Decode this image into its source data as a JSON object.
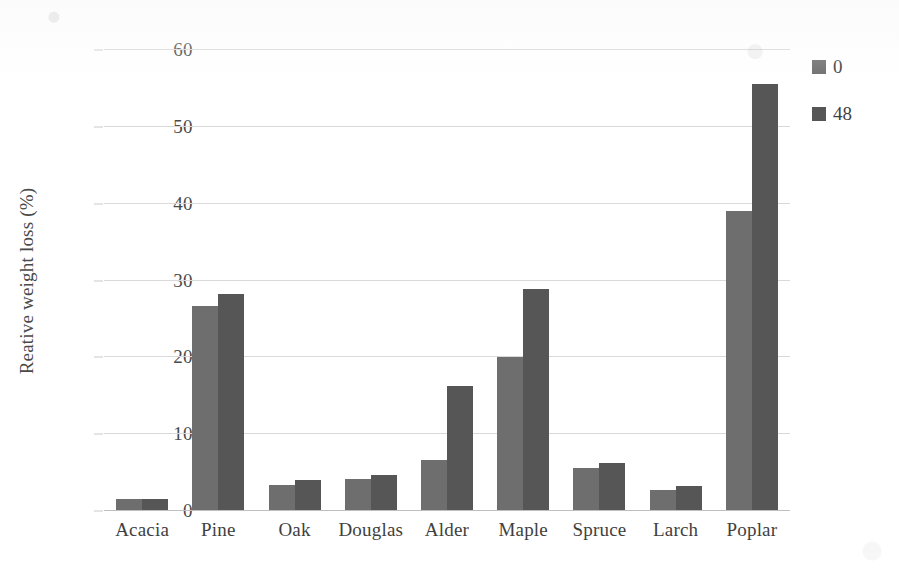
{
  "chart_data": {
    "type": "bar",
    "title": "",
    "subtitle": "",
    "xlabel": "",
    "ylabel": "Reative weight loss (%)",
    "categories": [
      "Acacia",
      "Pine",
      "Oak",
      "Douglas",
      "Alder",
      "Maple",
      "Spruce",
      "Larch",
      "Poplar"
    ],
    "series": [
      {
        "name": "0",
        "color": "#6e6e6e",
        "values": [
          1.6,
          26.7,
          3.4,
          4.2,
          6.7,
          20.0,
          5.6,
          2.7,
          39.0
        ]
      },
      {
        "name": "48",
        "color": "#565656",
        "values": [
          1.6,
          28.2,
          4.0,
          4.7,
          16.3,
          28.9,
          6.2,
          3.2,
          55.6
        ]
      }
    ],
    "ylim": [
      0,
      60
    ],
    "yticks": [
      "0",
      "10",
      "20",
      "30",
      "40",
      "50",
      "60"
    ],
    "ytick_values": [
      0,
      10,
      20,
      30,
      40,
      50,
      60
    ],
    "grid": "horizontal",
    "legend_position": "right-top",
    "legend_entries": [
      {
        "label": "0",
        "color": "#6e6e6e"
      },
      {
        "label": "48",
        "color": "#565656"
      }
    ]
  }
}
